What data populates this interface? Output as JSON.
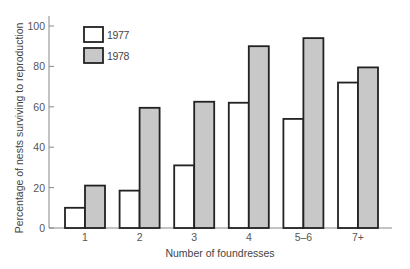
{
  "chart_data": {
    "type": "bar",
    "title": "",
    "xlabel": "Number of foundresses",
    "ylabel": "Percentage of nests surviving to reproduction",
    "categories": [
      "1",
      "2",
      "3",
      "4",
      "5–6",
      "7+"
    ],
    "series": [
      {
        "name": "1977",
        "color": "#ffffff",
        "values": [
          10,
          18.5,
          31,
          62,
          54,
          72
        ]
      },
      {
        "name": "1978",
        "color": "#c8c8c8",
        "values": [
          21,
          59.5,
          62.5,
          90,
          94,
          79.5
        ]
      }
    ],
    "ylim": [
      0,
      100
    ],
    "yticks": [
      0,
      20,
      40,
      60,
      80,
      100
    ],
    "grid": false,
    "legend_position": "upper-left inside"
  },
  "colors": {
    "axis": "#888888",
    "bar_outline": "#222222",
    "fill_1977": "#ffffff",
    "fill_1978": "#c8c8c8"
  }
}
